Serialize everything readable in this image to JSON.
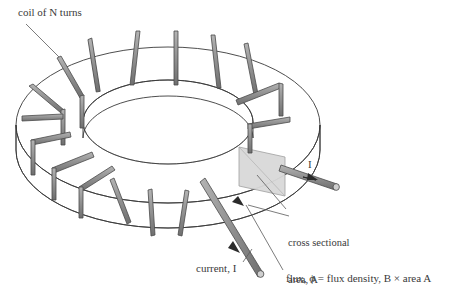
{
  "figure": {
    "type": "technical-illustration",
    "background_color": "#ffffff",
    "line_color": "#3a3a3a",
    "coil_color": "#8a8a8a",
    "coil_edge_color": "#4a4a4a",
    "cross_section_fill": "#d9d9d9"
  },
  "labels": {
    "coil": "coil of N turns",
    "current": "current, I",
    "cross_section_line1": "cross sectional",
    "cross_section_line2": "area, A",
    "flux": "flux, ϕ = flux density, B × area A",
    "current_right": "I"
  },
  "geometry": {
    "turn_count_visible": 16,
    "core_shape": "toroid",
    "outer_ellipse": {
      "cx": 168,
      "cy": 125,
      "rx": 152,
      "ry": 78
    },
    "inner_ellipse": {
      "cx": 168,
      "cy": 122,
      "rx": 85,
      "ry": 42
    },
    "core_depth_px": 36
  }
}
